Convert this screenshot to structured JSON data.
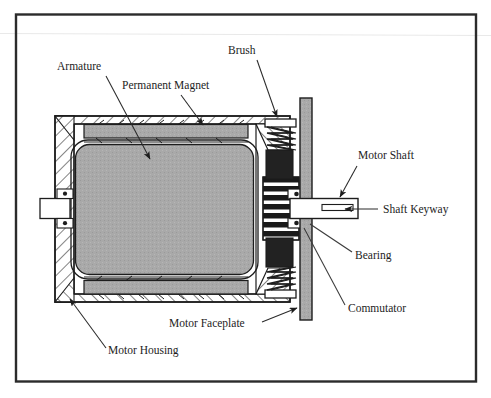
{
  "figure": {
    "kind": "cutaway-cross-section-diagram",
    "frame": {
      "border_color": "#2b2b2b",
      "background": "#ffffff"
    },
    "scan_line_color": "#e8e8e8"
  },
  "labels": [
    {
      "id": "armature",
      "text": "Armature",
      "x": 57,
      "y": 70,
      "anchor": "start"
    },
    {
      "id": "permanent-magnet",
      "text": "Permanent Magnet",
      "x": 122,
      "y": 89,
      "anchor": "start"
    },
    {
      "id": "brush",
      "text": "Brush",
      "x": 228,
      "y": 54,
      "anchor": "start"
    },
    {
      "id": "motor-shaft",
      "text": "Motor Shaft",
      "x": 358,
      "y": 159,
      "anchor": "start"
    },
    {
      "id": "shaft-keyway",
      "text": "Shaft Keyway",
      "x": 383,
      "y": 213,
      "anchor": "start"
    },
    {
      "id": "bearing",
      "text": "Bearing",
      "x": 355,
      "y": 259,
      "anchor": "start"
    },
    {
      "id": "commutator",
      "text": "Commutator",
      "x": 348,
      "y": 312,
      "anchor": "start"
    },
    {
      "id": "motor-faceplate",
      "text": "Motor Faceplate",
      "x": 169,
      "y": 327,
      "anchor": "start"
    },
    {
      "id": "motor-housing",
      "text": "Motor Housing",
      "x": 108,
      "y": 354,
      "anchor": "start"
    }
  ],
  "leaders": [
    {
      "id": "armature-leader",
      "from": [
        106,
        76
      ],
      "to": [
        150,
        161
      ],
      "arrow": true
    },
    {
      "id": "permanent-magnet-leader",
      "from": [
        180,
        95
      ],
      "to": [
        204,
        127
      ],
      "arrow": true
    },
    {
      "id": "brush-leader",
      "from": [
        258,
        60
      ],
      "to": [
        278,
        119
      ],
      "arrow": true
    },
    {
      "id": "motor-shaft-leader",
      "from": [
        357,
        166
      ],
      "to": [
        340,
        199
      ],
      "arrow": true
    },
    {
      "id": "shaft-keyway-leader",
      "from": [
        378,
        209
      ],
      "to": [
        343,
        209
      ],
      "arrow": true
    },
    {
      "id": "bearing-leader",
      "from": [
        352,
        252
      ],
      "to": [
        312,
        224
      ],
      "arrow": false
    },
    {
      "id": "commutator-leader",
      "from": [
        345,
        305
      ],
      "to": [
        305,
        232
      ],
      "arrow": false
    },
    {
      "id": "motor-faceplate-leader",
      "from": [
        262,
        322
      ],
      "to": [
        298,
        308
      ],
      "arrow": true
    },
    {
      "id": "motor-housing-leader",
      "from": [
        106,
        348
      ],
      "to": [
        68,
        297
      ],
      "arrow": true
    }
  ],
  "colors": {
    "outline": "#1d1d1d",
    "armature_fill": "#a8a8a8",
    "magnet_fill": "#a8a8a8",
    "faceplate_fill": "#a8a8a8",
    "brush_fill": "#222222",
    "commutator_dark": "#1a1a1a",
    "commutator_light": "#ffffff",
    "housing_fill": "#ffffff",
    "hatch_stroke": "#1d1d1d",
    "shaft_fill": "#ffffff"
  },
  "parts": {
    "motor_housing": {
      "x": 55,
      "y": 116,
      "width": 235,
      "height": 186,
      "note": "hatched section walls"
    },
    "permanent_magnet_top": {
      "x": 84,
      "y": 124,
      "width": 162,
      "height": 13
    },
    "permanent_magnet_bottom": {
      "x": 84,
      "y": 281,
      "width": 162,
      "height": 13
    },
    "armature": {
      "x": 73,
      "y": 141,
      "width": 183,
      "height": 136,
      "corner_radius": 16
    },
    "motor_faceplate": {
      "x": 300,
      "y": 98,
      "width": 11,
      "height": 222
    },
    "motor_shaft": {
      "x": 311,
      "y": 199,
      "width": 47,
      "height": 19
    },
    "shaft_keyway": {
      "x": 325,
      "y": 205,
      "width": 28,
      "height": 6
    },
    "left_shaft_stub": {
      "x": 40,
      "y": 199,
      "width": 28,
      "height": 19
    },
    "commutator": {
      "x": 265,
      "y": 178,
      "width": 32,
      "height": 60,
      "bars": 7
    },
    "brush_top": {
      "x": 268,
      "y": 152,
      "width": 24,
      "height": 28
    },
    "brush_bottom": {
      "x": 268,
      "y": 236,
      "width": 24,
      "height": 28
    },
    "spring_top": {
      "x": 268,
      "y": 121,
      "width": 26,
      "height": 32,
      "coils": 6
    },
    "spring_bottom": {
      "x": 268,
      "y": 264,
      "width": 26,
      "height": 32,
      "coils": 6
    }
  }
}
